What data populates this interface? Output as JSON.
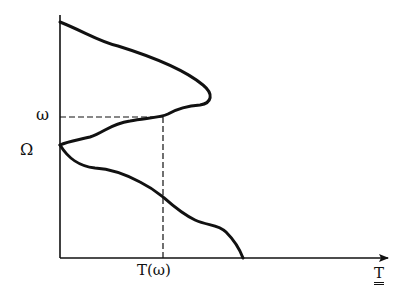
{
  "diagram": {
    "labels": {
      "omega": "ω",
      "Omega": "Ω",
      "T_of_omega": "T(ω)",
      "x_axis": "T"
    },
    "colors": {
      "stroke": "#111111",
      "background": "#ffffff"
    },
    "axes": {
      "y_axis": {
        "x": 60,
        "y_top": 15,
        "y_bottom": 258,
        "arrow": false
      },
      "x_axis": {
        "y": 258,
        "x_left": 60,
        "x_right": 388,
        "arrow": true
      }
    },
    "curve": {
      "description": "Curve starting at top of y-axis, bulging right to a peak, returning to Ω on the y-axis, then descending to the x-axis",
      "peak_point": [
        210,
        97
      ],
      "omega_intersection": [
        163,
        117
      ],
      "Omega_point": [
        60,
        145
      ],
      "x_axis_end": [
        243,
        258
      ]
    },
    "guides": {
      "horizontal_dashed_at_omega": {
        "y": 117,
        "x_from": 60,
        "x_to": 163
      },
      "vertical_dashed_at_T_omega": {
        "x": 163,
        "y_from": 117,
        "y_to": 258
      }
    }
  }
}
